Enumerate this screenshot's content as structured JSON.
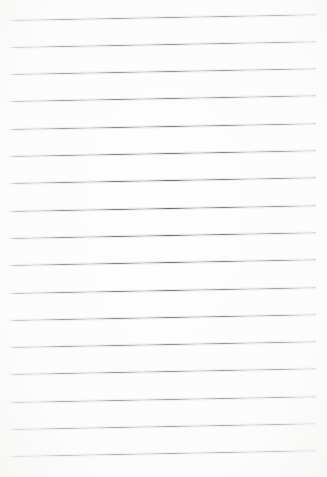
{
  "image": {
    "subject": "blank ruled notepad paper",
    "width_px": 327,
    "height_px": 477,
    "background_color": "#fefefe",
    "rule_color": "#595959",
    "rule_count": 17,
    "rule_thickness_px": 1,
    "rule_spacing_px": 27.3,
    "rule_left_x_px": 9,
    "rule_right_x_px": 316,
    "rule_skew_deg": -1.05,
    "first_rule_y_px": 19.5,
    "last_rule_y_px": 456,
    "written_text": "",
    "margin_rule": "none",
    "holes": "none"
  },
  "rules": [
    {
      "index": 1,
      "y_left_px": 19.5,
      "y_right_px": 13.8
    },
    {
      "index": 2,
      "y_left_px": 46.8,
      "y_right_px": 41.1
    },
    {
      "index": 3,
      "y_left_px": 74.1,
      "y_right_px": 68.4
    },
    {
      "index": 4,
      "y_left_px": 101.4,
      "y_right_px": 95.7
    },
    {
      "index": 5,
      "y_left_px": 128.7,
      "y_right_px": 123.0
    },
    {
      "index": 6,
      "y_left_px": 156.0,
      "y_right_px": 150.3
    },
    {
      "index": 7,
      "y_left_px": 183.3,
      "y_right_px": 177.6
    },
    {
      "index": 8,
      "y_left_px": 210.6,
      "y_right_px": 204.9
    },
    {
      "index": 9,
      "y_left_px": 237.9,
      "y_right_px": 232.2
    },
    {
      "index": 10,
      "y_left_px": 265.2,
      "y_right_px": 259.5
    },
    {
      "index": 11,
      "y_left_px": 292.5,
      "y_right_px": 286.8
    },
    {
      "index": 12,
      "y_left_px": 319.8,
      "y_right_px": 314.1
    },
    {
      "index": 13,
      "y_left_px": 347.1,
      "y_right_px": 341.4
    },
    {
      "index": 14,
      "y_left_px": 374.4,
      "y_right_px": 368.7
    },
    {
      "index": 15,
      "y_left_px": 401.7,
      "y_right_px": 396.0
    },
    {
      "index": 16,
      "y_left_px": 429.0,
      "y_right_px": 423.3
    },
    {
      "index": 17,
      "y_left_px": 456.3,
      "y_right_px": 450.6
    }
  ]
}
